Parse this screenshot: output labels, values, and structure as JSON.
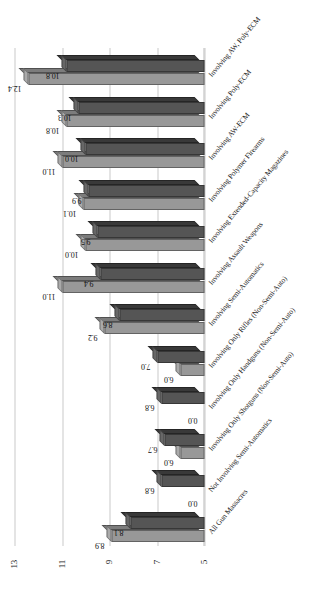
{
  "chart_data": {
    "type": "bar",
    "title": "",
    "subtitle": "",
    "xlabel": "",
    "ylabel": "",
    "orientation": "vertical-rotated",
    "grid": true,
    "legend_position": "none",
    "ylim": [
      5,
      13
    ],
    "yticks": [
      5,
      7,
      9,
      11,
      13
    ],
    "ytick_labels": [
      "5",
      "7",
      "9",
      "11",
      "13"
    ],
    "categories": [
      "All Gun Massacres",
      "Not Involving Semi-Automatics",
      "Involving Only Shotguns (Non-Semi-Auto)",
      "Involving Only Handguns (Non-Semi-Auto)",
      "Involving Only Rifles (Non-Semi-Auto)",
      "Involving Semi-Automatics",
      "Involving Assault Weapons",
      "Involving Extended-Capacity Magazines",
      "Involving Polymer Firearms",
      "Involving AW-ECM",
      "Involving Poly-ECM",
      "Involving AW, Poly-ECM"
    ],
    "series": [
      {
        "name": "Series 1",
        "color": "#989898",
        "values": [
          8.9,
          0.0,
          6.0,
          0.0,
          6.0,
          9.2,
          11.0,
          10.0,
          10.1,
          11.0,
          10.8,
          12.4
        ]
      },
      {
        "name": "Series 2",
        "color": "#555555",
        "values": [
          8.1,
          6.8,
          6.7,
          6.8,
          7.0,
          8.6,
          9.4,
          9.5,
          9.9,
          10.0,
          10.3,
          10.8
        ]
      }
    ],
    "value_labels": {
      "series1": [
        "8.9",
        "0.0",
        "6.0",
        "0.0",
        "6.0",
        "9.2",
        "11.0",
        "10.0",
        "10.1",
        "11.0",
        "10.8",
        "12.4"
      ],
      "series2": [
        "8.1",
        "6.8",
        "6.7",
        "6.8",
        "7.0",
        "8.6",
        "9.4",
        "9.5",
        "9.9",
        "10.0",
        "10.3",
        "10.8"
      ]
    }
  }
}
